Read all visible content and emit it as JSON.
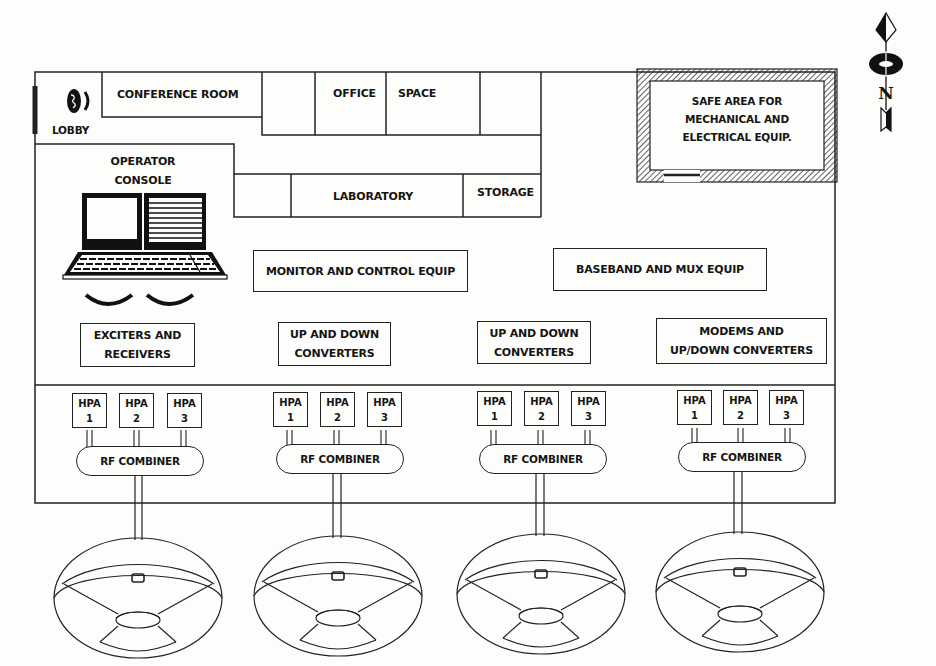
{
  "figure": {
    "type": "earth-station-floor-plan",
    "rooms": {
      "lobby": "LOBBY",
      "conference_room": "CONFERENCE ROOM",
      "office_space": [
        "OFFICE",
        "SPACE"
      ],
      "operator_console": [
        "OPERATOR",
        "CONSOLE"
      ],
      "laboratory": "LABORATORY",
      "storage": "STORAGE",
      "safe_area": [
        "SAFE AREA FOR",
        "MECHANICAL AND",
        "ELECTRICAL EQUIP."
      ]
    },
    "equipment": {
      "monitor_control": "MONITOR AND CONTROL EQUIP",
      "baseband_mux": "BASEBAND AND MUX EQUIP",
      "exciters_receivers": [
        "EXCITERS AND",
        "RECEIVERS"
      ],
      "up_down_converters": [
        "UP AND DOWN",
        "CONVERTERS"
      ],
      "modems_converters": [
        "MODEMS AND",
        "UP/DOWN CONVERTERS"
      ]
    },
    "rf_chains": [
      {
        "hpas": [
          {
            "label": "HPA",
            "num": "1"
          },
          {
            "label": "HPA",
            "num": "2"
          },
          {
            "label": "HPA",
            "num": "3"
          }
        ],
        "combiner": "RF COMBINER"
      },
      {
        "hpas": [
          {
            "label": "HPA",
            "num": "1"
          },
          {
            "label": "HPA",
            "num": "2"
          },
          {
            "label": "HPA",
            "num": "3"
          }
        ],
        "combiner": "RF COMBINER"
      },
      {
        "hpas": [
          {
            "label": "HPA",
            "num": "1"
          },
          {
            "label": "HPA",
            "num": "2"
          },
          {
            "label": "HPA",
            "num": "3"
          }
        ],
        "combiner": "RF COMBINER"
      },
      {
        "hpas": [
          {
            "label": "HPA",
            "num": "1"
          },
          {
            "label": "HPA",
            "num": "2"
          },
          {
            "label": "HPA",
            "num": "3"
          }
        ],
        "combiner": "RF COMBINER"
      }
    ],
    "antenna_count": 4,
    "north_arrow": {
      "letter": "N",
      "icon": "north-arrow-icon"
    },
    "colors": {
      "ink": "#151515",
      "paper": "#fdfdfb"
    }
  }
}
